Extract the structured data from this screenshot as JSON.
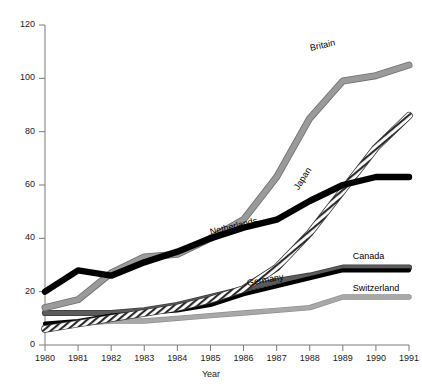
{
  "chart_data": {
    "type": "line",
    "title": "",
    "xlabel": "Year",
    "ylabel": "",
    "x": [
      1980,
      1981,
      1982,
      1983,
      1984,
      1985,
      1986,
      1987,
      1988,
      1989,
      1990,
      1991
    ],
    "xlim": [
      1980,
      1991
    ],
    "ylim": [
      0,
      120
    ],
    "yticks": [
      0,
      20,
      40,
      60,
      80,
      100,
      120
    ],
    "xticks": [
      "1980",
      "1981",
      "1982",
      "1983",
      "1984",
      "1985",
      "1986",
      "1987",
      "1988",
      "1989",
      "1990",
      "1991"
    ],
    "grid": false,
    "legend": "inline-labels",
    "series": [
      {
        "name": "Britain",
        "style": "solid-grey",
        "color": "#9a9a9a",
        "values": [
          14,
          17,
          27,
          33,
          34,
          40,
          47,
          63,
          85,
          99,
          101,
          105
        ],
        "label_x": 1988.0,
        "label_y": 111
      },
      {
        "name": "Japan",
        "style": "hatched-white",
        "color": "#ffffff",
        "values": [
          6,
          8,
          10,
          12,
          14,
          17,
          21,
          29,
          42,
          58,
          74,
          86
        ],
        "label_x": 1987.6,
        "label_y": 58
      },
      {
        "name": "Netherlands",
        "style": "solid-black",
        "color": "#000000",
        "values": [
          20,
          28,
          26,
          31,
          35,
          40,
          44,
          47,
          54,
          60,
          63,
          63
        ],
        "label_x": 1985.0,
        "label_y": 42
      },
      {
        "name": "Canada",
        "style": "solid-darkgrey",
        "color": "#5c5c5c",
        "values": [
          12,
          12,
          12,
          13,
          15,
          18,
          21,
          24,
          26,
          29,
          29,
          29
        ],
        "label_x": 1989.3,
        "label_y": 33
      },
      {
        "name": "Germany",
        "style": "solid-black-thin",
        "color": "#000000",
        "values": [
          8,
          9,
          11,
          12,
          13,
          15,
          19,
          22,
          25,
          28,
          28,
          28
        ],
        "label_x": 1986.1,
        "label_y": 23
      },
      {
        "name": "Switzerland",
        "style": "solid-lightgrey",
        "color": "#a8a8a8",
        "values": [
          7,
          8,
          9,
          9,
          10,
          11,
          12,
          13,
          14,
          18,
          18,
          18
        ],
        "label_x": 1989.3,
        "label_y": 21
      }
    ],
    "colors": {
      "axis": "#7a7a7a",
      "text": "#1a1a1a",
      "britain": "#9a9a9a",
      "japan": "#ffffff",
      "netherlands": "#000000",
      "canada": "#5c5c5c",
      "germany": "#000000",
      "switzerland": "#a8a8a8"
    }
  }
}
